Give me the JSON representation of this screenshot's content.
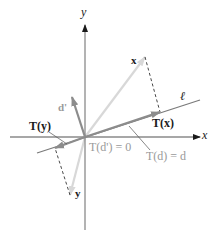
{
  "figure": {
    "colors": {
      "axis": "#8a8a8a",
      "axis_arrow": "#1a1a1a",
      "line_l": "#7a7a7a",
      "vector_dark": "#8c8c8c",
      "vector_light": "#d8d8d8",
      "dashed": "#333333",
      "leader": "#555555",
      "label_dark": "#1a1a1a",
      "label_gray": "#9a9a9a"
    },
    "labels": {
      "y_axis": "y",
      "x_axis": "x",
      "line": "ℓ",
      "vec_x": "x",
      "vec_y": "y",
      "vec_d_prime": "d'",
      "T_x": "T(x)",
      "T_y": "T(y)",
      "T_d_prime": "T(d') = 0",
      "T_d": "T(d) = d"
    },
    "geometry": {
      "origin": [
        85,
        137
      ],
      "x_axis": {
        "from": [
          10,
          137
        ],
        "to": [
          200,
          137
        ]
      },
      "y_axis": {
        "from": [
          85,
          230
        ],
        "to": [
          85,
          25
        ]
      },
      "line_l": {
        "from": [
          37,
          153
        ],
        "to": [
          200,
          100
        ]
      },
      "vec_x_tip": [
        145,
        57
      ],
      "T_x_tip": [
        160,
        112
      ],
      "vec_y_tip": [
        70,
        195
      ],
      "T_y_tip": [
        55,
        148
      ],
      "d_prime_tip": [
        72,
        97
      ]
    }
  }
}
